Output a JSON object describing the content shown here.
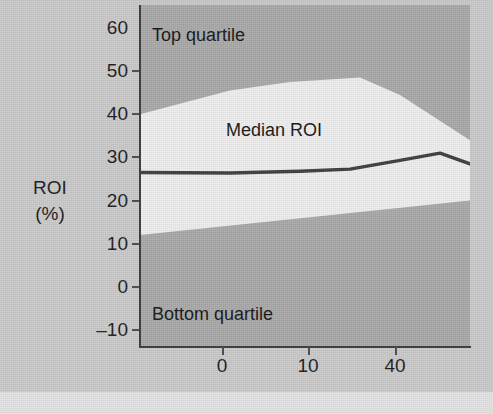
{
  "figure": {
    "background_color": "#c9c9c9",
    "plot_background_color": "#a8a8a8",
    "band_color": "#ededed",
    "median_line_color": "#3d3d3d",
    "axis_color": "#3a3a3a",
    "text_color": "#1b1b1b",
    "caption": ""
  },
  "axes": {
    "y_title_line1": "ROI",
    "y_title_line2": "(%)",
    "y_ticks": [
      {
        "label": "60",
        "value": 60
      },
      {
        "label": "50",
        "value": 50
      },
      {
        "label": "40",
        "value": 40
      },
      {
        "label": "30",
        "value": 30
      },
      {
        "label": "20",
        "value": 20
      },
      {
        "label": "10",
        "value": 10
      },
      {
        "label": "0",
        "value": 0
      },
      {
        "label": "–10",
        "value": -10
      }
    ],
    "x_ticks": [
      {
        "label": "0",
        "px": 222
      },
      {
        "label": "10",
        "px": 308
      },
      {
        "label": "40",
        "px": 395
      }
    ]
  },
  "labels": {
    "top_quartile": "Top quartile",
    "median_roi": "Median ROI",
    "bottom_quartile": "Bottom quartile"
  },
  "chart_data": {
    "type": "area",
    "title": "",
    "xlabel": "",
    "ylabel": "ROI (%)",
    "ylim": [
      -13,
      62
    ],
    "grid": false,
    "legend_position": "in-plot annotations",
    "x_tick_labels": [
      "0",
      "10",
      "40"
    ],
    "x_tick_pixels": [
      222,
      308,
      395
    ],
    "y_tick_labels": [
      "60",
      "50",
      "40",
      "30",
      "20",
      "10",
      "0",
      "-10"
    ],
    "annotations": [
      {
        "text": "Top quartile",
        "region": "above upper boundary"
      },
      {
        "text": "Median ROI",
        "region": "between quartile boundaries"
      },
      {
        "text": "Bottom quartile",
        "region": "below lower boundary"
      }
    ],
    "series": [
      {
        "name": "Top quartile boundary",
        "role": "upper_band_edge",
        "x_px": [
          140,
          230,
          290,
          360,
          400,
          470
        ],
        "values": [
          40.0,
          45.5,
          47.5,
          48.5,
          44.5,
          34.0
        ]
      },
      {
        "name": "Bottom quartile boundary",
        "role": "lower_band_edge",
        "x_px": [
          140,
          470
        ],
        "values": [
          12.0,
          20.0
        ]
      },
      {
        "name": "Median ROI",
        "role": "line",
        "x_px": [
          140,
          230,
          300,
          350,
          400,
          440,
          470
        ],
        "values": [
          26.5,
          26.4,
          26.8,
          27.3,
          29.3,
          31.0,
          28.5
        ]
      }
    ]
  }
}
